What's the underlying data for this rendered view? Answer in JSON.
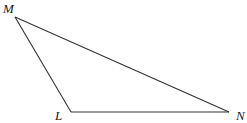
{
  "diagram": {
    "type": "triangle",
    "vertices": [
      {
        "id": "M",
        "label": "M",
        "x": 15,
        "y": 17,
        "label_x": 3,
        "label_y": 13
      },
      {
        "id": "L",
        "label": "L",
        "x": 71,
        "y": 112,
        "label_x": 55,
        "label_y": 120
      },
      {
        "id": "N",
        "label": "N",
        "x": 229,
        "y": 112,
        "label_x": 236,
        "label_y": 120
      }
    ],
    "edges": [
      {
        "from": "M",
        "to": "L"
      },
      {
        "from": "L",
        "to": "N"
      },
      {
        "from": "N",
        "to": "M"
      }
    ],
    "stroke_color": "#333333",
    "background": "#ffffff"
  }
}
